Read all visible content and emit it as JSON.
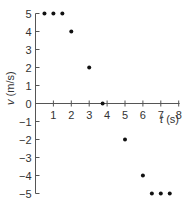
{
  "chart_data": {
    "type": "scatter",
    "title": "",
    "xlabel": "t (s)",
    "ylabel": "v (m/s)",
    "xlim": [
      0,
      8
    ],
    "ylim": [
      -5,
      5
    ],
    "grid": false,
    "x_ticks": [
      1,
      2,
      3,
      4,
      5,
      6,
      7,
      8
    ],
    "y_ticks": [
      5,
      4,
      3,
      2,
      1,
      0,
      -1,
      -2,
      -3,
      -4,
      -5
    ],
    "x_tick_labels": [
      "1",
      "2",
      "3",
      "4",
      "5",
      "6",
      "7",
      "8"
    ],
    "y_tick_labels": [
      "5",
      "4",
      "3",
      "2",
      "1",
      "0",
      "−1",
      "−2",
      "−3",
      "−4",
      "−5"
    ],
    "series": [
      {
        "name": "velocity",
        "x": [
          0.5,
          1,
          1.5,
          2,
          3,
          3.75,
          5,
          6,
          6.5,
          7,
          7.5
        ],
        "y": [
          5,
          5,
          5,
          4,
          2,
          0,
          -2,
          -4,
          -5,
          -5,
          -5
        ]
      }
    ]
  },
  "labels": {
    "xlabel_t": "t",
    "xlabel_unit": "(s)",
    "ylabel_v": "v",
    "ylabel_unit": "(m/s)"
  }
}
